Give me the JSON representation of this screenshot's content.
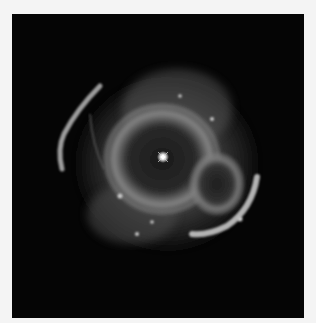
{
  "image": {
    "subject": "planetary nebula",
    "description": "Grayscale astronomical image of a planetary nebula with a bright central star, nested shell structures, and fragmented outer arcs on a black background",
    "colors": {
      "page_background": "#f4f4f4",
      "sky_background": "#050505",
      "nebula_glow": "#8a8a8a",
      "bright_filaments": "#d8d8d8",
      "central_star": "#ffffff"
    }
  }
}
